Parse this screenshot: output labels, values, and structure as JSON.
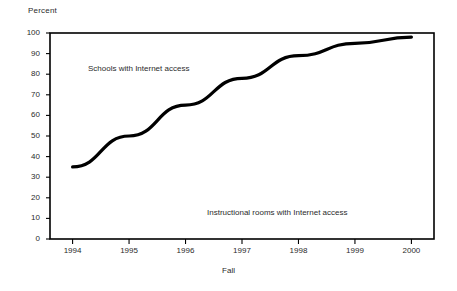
{
  "figure": {
    "y_axis_title": "Percent",
    "x_axis_title": "Fall",
    "series_label_upper": "Schools with Internet access",
    "series_label_lower": "Instructional rooms with Internet access",
    "line_color": "#000000",
    "frame_color": "#000000",
    "background_color": "#ffffff"
  },
  "chart_data": {
    "type": "line",
    "title": "",
    "xlabel": "Fall",
    "ylabel": "Percent",
    "xlim": [
      1993.6,
      2000.4
    ],
    "ylim": [
      0,
      100
    ],
    "grid": false,
    "legend": "inline-annotations",
    "categories": [
      1994,
      1995,
      1996,
      1997,
      1998,
      1999,
      2000
    ],
    "x_tick_labels": [
      "1994",
      "1995",
      "1996",
      "1997",
      "1998",
      "1999",
      "2000"
    ],
    "y_tick_labels": [
      "0",
      "10",
      "20",
      "30",
      "40",
      "50",
      "60",
      "70",
      "80",
      "90",
      "100"
    ],
    "y_ticks": [
      0,
      10,
      20,
      30,
      40,
      50,
      60,
      70,
      80,
      90,
      100
    ],
    "series": [
      {
        "name": "Schools with Internet access",
        "x": [
          1994,
          1995,
          1996,
          1997,
          1998,
          1999,
          2000
        ],
        "values": [
          35,
          50,
          65,
          78,
          89,
          95,
          98
        ]
      }
    ],
    "annotations": [
      {
        "text": "Schools with Internet access",
        "x": 1994.4,
        "y": 82
      },
      {
        "text": "Instructional rooms with Internet access",
        "x": 1996.6,
        "y": 16
      }
    ]
  }
}
